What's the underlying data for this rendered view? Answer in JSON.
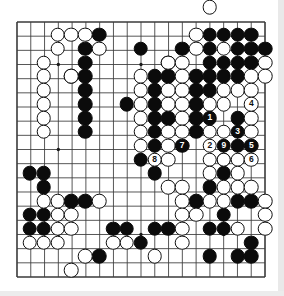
{
  "app": {
    "kind": "go-game-diagram",
    "title": "Go board diagram",
    "board_size": 19,
    "colors": {
      "board_background": "#ffffff",
      "line": "#3a3a3a",
      "border": "#1a1a1a",
      "black_stone": "#0b0b0b",
      "white_stone": "#ffffff",
      "white_stone_border": "#101010",
      "black_label": "#ffffff",
      "white_label": "#101010",
      "page_background": "#ffffff"
    }
  },
  "board": {
    "size": 19,
    "origin_x": 16,
    "origin_y": 21,
    "spacing": 13.85,
    "star_points": [
      [
        4,
        4
      ],
      [
        10,
        4
      ],
      [
        16,
        4
      ],
      [
        4,
        10
      ],
      [
        10,
        10
      ],
      [
        16,
        10
      ],
      [
        4,
        16
      ],
      [
        10,
        16
      ],
      [
        16,
        16
      ]
    ],
    "black_stones": [
      [
        7,
        2
      ],
      [
        15,
        2
      ],
      [
        16,
        2
      ],
      [
        17,
        2
      ],
      [
        18,
        2
      ],
      [
        6,
        3
      ],
      [
        10,
        3
      ],
      [
        13,
        3
      ],
      [
        15,
        3
      ],
      [
        17,
        3
      ],
      [
        18,
        3
      ],
      [
        19,
        3
      ],
      [
        6,
        4
      ],
      [
        12,
        4
      ],
      [
        15,
        4
      ],
      [
        16,
        4
      ],
      [
        17,
        4
      ],
      [
        18,
        4
      ],
      [
        5,
        5
      ],
      [
        6,
        5
      ],
      [
        11,
        5
      ],
      [
        12,
        5
      ],
      [
        14,
        5
      ],
      [
        15,
        5
      ],
      [
        16,
        5
      ],
      [
        17,
        5
      ],
      [
        6,
        6
      ],
      [
        11,
        6
      ],
      [
        14,
        6
      ],
      [
        15,
        6
      ],
      [
        6,
        7
      ],
      [
        9,
        7
      ],
      [
        11,
        7
      ],
      [
        14,
        7
      ],
      [
        6,
        8
      ],
      [
        11,
        8
      ],
      [
        12,
        8
      ],
      [
        14,
        8
      ],
      [
        17,
        8
      ],
      [
        6,
        9
      ],
      [
        11,
        9
      ],
      [
        14,
        9
      ],
      [
        17,
        9
      ],
      [
        11,
        10
      ],
      [
        13,
        10
      ],
      [
        17,
        10
      ],
      [
        18,
        10
      ],
      [
        10,
        11
      ],
      [
        16,
        11
      ],
      [
        18,
        11
      ],
      [
        2,
        12
      ],
      [
        3,
        12
      ],
      [
        11,
        12
      ],
      [
        16,
        12
      ],
      [
        3,
        13
      ],
      [
        15,
        13
      ],
      [
        5,
        14
      ],
      [
        6,
        14
      ],
      [
        14,
        14
      ],
      [
        17,
        14
      ],
      [
        18,
        14
      ],
      [
        2,
        15
      ],
      [
        3,
        15
      ],
      [
        16,
        15
      ],
      [
        2,
        16
      ],
      [
        3,
        16
      ],
      [
        8,
        16
      ],
      [
        9,
        16
      ],
      [
        11,
        16
      ],
      [
        12,
        16
      ],
      [
        15,
        16
      ],
      [
        16,
        16
      ],
      [
        10,
        17
      ],
      [
        18,
        17
      ],
      [
        7,
        18
      ],
      [
        15,
        18
      ],
      [
        17,
        18
      ],
      [
        18,
        18
      ]
    ],
    "white_stones": [
      [
        4,
        2
      ],
      [
        5,
        2
      ],
      [
        6,
        2
      ],
      [
        14,
        2
      ],
      [
        4,
        3
      ],
      [
        7,
        3
      ],
      [
        14,
        3
      ],
      [
        16,
        3
      ],
      [
        3,
        4
      ],
      [
        12,
        4
      ],
      [
        13,
        4
      ],
      [
        19,
        4
      ],
      [
        3,
        5
      ],
      [
        5,
        5
      ],
      [
        10,
        5
      ],
      [
        13,
        5
      ],
      [
        18,
        5
      ],
      [
        19,
        5
      ],
      [
        3,
        6
      ],
      [
        10,
        6
      ],
      [
        12,
        6
      ],
      [
        13,
        6
      ],
      [
        16,
        6
      ],
      [
        17,
        6
      ],
      [
        18,
        6
      ],
      [
        3,
        7
      ],
      [
        10,
        7
      ],
      [
        12,
        7
      ],
      [
        13,
        7
      ],
      [
        15,
        7
      ],
      [
        16,
        7
      ],
      [
        18,
        7
      ],
      [
        3,
        8
      ],
      [
        10,
        8
      ],
      [
        13,
        8
      ],
      [
        15,
        8
      ],
      [
        18,
        8
      ],
      [
        3,
        9
      ],
      [
        10,
        9
      ],
      [
        12,
        9
      ],
      [
        13,
        9
      ],
      [
        15,
        9
      ],
      [
        16,
        9
      ],
      [
        18,
        9
      ],
      [
        10,
        10
      ],
      [
        12,
        10
      ],
      [
        15,
        10
      ],
      [
        16,
        10
      ],
      [
        11,
        11
      ],
      [
        12,
        11
      ],
      [
        15,
        11
      ],
      [
        16,
        11
      ],
      [
        17,
        11
      ],
      [
        18,
        11
      ],
      [
        15,
        12
      ],
      [
        17,
        12
      ],
      [
        12,
        13
      ],
      [
        13,
        13
      ],
      [
        16,
        13
      ],
      [
        17,
        13
      ],
      [
        18,
        13
      ],
      [
        3,
        14
      ],
      [
        4,
        14
      ],
      [
        7,
        14
      ],
      [
        13,
        14
      ],
      [
        15,
        14
      ],
      [
        16,
        14
      ],
      [
        19,
        14
      ],
      [
        4,
        15
      ],
      [
        5,
        15
      ],
      [
        13,
        15
      ],
      [
        14,
        15
      ],
      [
        19,
        15
      ],
      [
        4,
        16
      ],
      [
        5,
        16
      ],
      [
        13,
        16
      ],
      [
        17,
        16
      ],
      [
        19,
        16
      ],
      [
        2,
        17
      ],
      [
        3,
        17
      ],
      [
        4,
        17
      ],
      [
        8,
        17
      ],
      [
        9,
        17
      ],
      [
        13,
        17
      ],
      [
        6,
        18
      ],
      [
        11,
        18
      ],
      [
        5,
        19
      ]
    ],
    "numbered_moves": [
      {
        "number": "1",
        "color": "black",
        "x": 15,
        "y": 8
      },
      {
        "number": "2",
        "color": "white",
        "x": 15,
        "y": 10
      },
      {
        "number": "3",
        "color": "black",
        "x": 17,
        "y": 9
      },
      {
        "number": "4",
        "color": "white",
        "x": 18,
        "y": 7
      },
      {
        "number": "5",
        "color": "black",
        "x": 18,
        "y": 10
      },
      {
        "number": "6",
        "color": "white",
        "x": 18,
        "y": 11
      },
      {
        "number": "7",
        "color": "black",
        "x": 13,
        "y": 10
      },
      {
        "number": "8",
        "color": "white",
        "x": 11,
        "y": 11
      },
      {
        "number": "9",
        "color": "black",
        "x": 16,
        "y": 10
      }
    ],
    "off_board_markers": [
      {
        "color": "white",
        "x": 15,
        "y": 0
      }
    ]
  }
}
